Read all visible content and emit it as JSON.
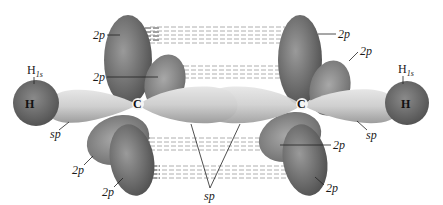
{
  "figure": {
    "atoms": [
      {
        "id": "H_left",
        "symbol": "H",
        "label": "H",
        "orbital_label": "H",
        "orbital_sub": "1s"
      },
      {
        "id": "C_left",
        "symbol": "C",
        "label": "C"
      },
      {
        "id": "C_right",
        "symbol": "C",
        "label": "C"
      },
      {
        "id": "H_right",
        "symbol": "H",
        "label": "H",
        "orbital_label": "H",
        "orbital_sub": "1s"
      }
    ],
    "labels": {
      "p_top_left_upper": "2p",
      "p_top_left_lower": "2p",
      "p_top_right_upper": "2p",
      "p_top_right_lower": "2p",
      "sp_left": "sp",
      "sp_center": "sp",
      "sp_right": "sp",
      "p_bottom_left_upper": "2p",
      "p_bottom_left_lower": "2p",
      "p_bottom_right_upper": "2p",
      "p_bottom_right_lower": "2p"
    },
    "colors": {
      "p_orbital": "#6e6e6e",
      "sp_orbital": "#c8c8c8",
      "h_orbital": "#707070",
      "overlap_dash": "#9a9a9a"
    }
  }
}
